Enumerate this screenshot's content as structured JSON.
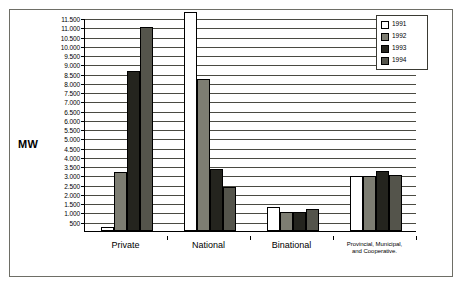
{
  "chart_data": {
    "type": "bar",
    "title": "",
    "xlabel": "",
    "ylabel": "MW",
    "ylim": [
      0,
      11500
    ],
    "ytick_step": 500,
    "grid": true,
    "legend_position": "top-right",
    "categories": [
      "Private",
      "National",
      "Binational",
      "Provincial, Municipal, and Cooperative."
    ],
    "category_label_lines": [
      [
        "Private"
      ],
      [
        "National"
      ],
      [
        "Binational"
      ],
      [
        "Provincial, Municipal,",
        "and Cooperative."
      ]
    ],
    "ytick_labels": [
      "11.500",
      "11.000",
      "10.500",
      "10.000",
      "9.500",
      "9.000",
      "8.500",
      "8.000",
      "7.500",
      "7.000",
      "6.500",
      "6.000",
      "5.500",
      "5.000",
      "4.500",
      "4.000",
      "3.500",
      "3.000",
      "2.500",
      "2.000",
      "1.500",
      "1.000",
      "500"
    ],
    "ytick_values": [
      11500,
      11000,
      10500,
      10000,
      9500,
      9000,
      8500,
      8000,
      7500,
      7000,
      6500,
      6000,
      5500,
      5000,
      4500,
      4000,
      3500,
      3000,
      2500,
      2000,
      1500,
      1000,
      500
    ],
    "series": [
      {
        "name": "1991",
        "color": "#ffffff",
        "values": [
          200,
          11700,
          1300,
          2950
        ]
      },
      {
        "name": "1992",
        "color": "#7d7d72",
        "values": [
          3200,
          8200,
          1050,
          2950
        ]
      },
      {
        "name": "1993",
        "color": "#24241e",
        "values": [
          8650,
          3350,
          1000,
          3250
        ]
      },
      {
        "name": "1994",
        "color": "#54544b",
        "values": [
          11000,
          2400,
          1200,
          3050
        ]
      }
    ]
  },
  "legend": {
    "items": [
      {
        "label": "1991",
        "swatch": "y1991"
      },
      {
        "label": "1992",
        "swatch": "y1992"
      },
      {
        "label": "1993",
        "swatch": "y1993"
      },
      {
        "label": "1994",
        "swatch": "y1994"
      }
    ]
  }
}
